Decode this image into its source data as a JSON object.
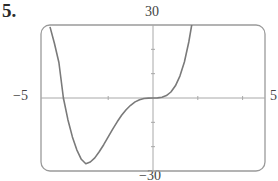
{
  "problem": {
    "number": "5."
  },
  "chart_data": {
    "type": "line",
    "title": "",
    "xlabel": "",
    "ylabel": "",
    "xlim": [
      -5,
      5
    ],
    "ylim": [
      -30,
      30
    ],
    "x_tick_labels": {
      "left": "−5",
      "right": "5"
    },
    "y_tick_labels": {
      "top": "30",
      "bottom": "−30"
    },
    "x_ticks": [
      -4,
      -2,
      0,
      2,
      4
    ],
    "y_ticks": [
      -20,
      -10,
      0,
      10,
      20
    ],
    "grid": false,
    "legend": null,
    "series": [
      {
        "name": "f(x)",
        "description": "quartic curve, approx. y = x^4 + 4x^3",
        "x": [
          -4.6,
          -4.4,
          -4.2,
          -4.0,
          -3.8,
          -3.6,
          -3.4,
          -3.2,
          -3.0,
          -2.8,
          -2.6,
          -2.4,
          -2.2,
          -2.0,
          -1.8,
          -1.6,
          -1.4,
          -1.2,
          -1.0,
          -0.8,
          -0.6,
          -0.4,
          -0.2,
          0.0,
          0.2,
          0.4,
          0.6,
          0.8,
          1.0,
          1.2,
          1.4,
          1.6,
          1.8,
          1.9
        ],
        "y": [
          29.2,
          22.5,
          14.6,
          0.0,
          -8.9,
          -16.0,
          -21.3,
          -25.2,
          -27.0,
          -26.3,
          -24.6,
          -22.1,
          -19.2,
          -16.0,
          -12.8,
          -9.8,
          -7.1,
          -4.8,
          -3.0,
          -1.6,
          -0.7,
          -0.2,
          -0.03,
          0.0,
          0.03,
          0.28,
          0.99,
          2.46,
          5.0,
          8.99,
          14.8,
          23.0,
          33.8,
          40.0
        ]
      }
    ]
  },
  "colors": {
    "frame": "#9a9a9a",
    "axes": "#a8a8a8",
    "curve": "#7a7a7a",
    "text": "#2a2a2a"
  }
}
